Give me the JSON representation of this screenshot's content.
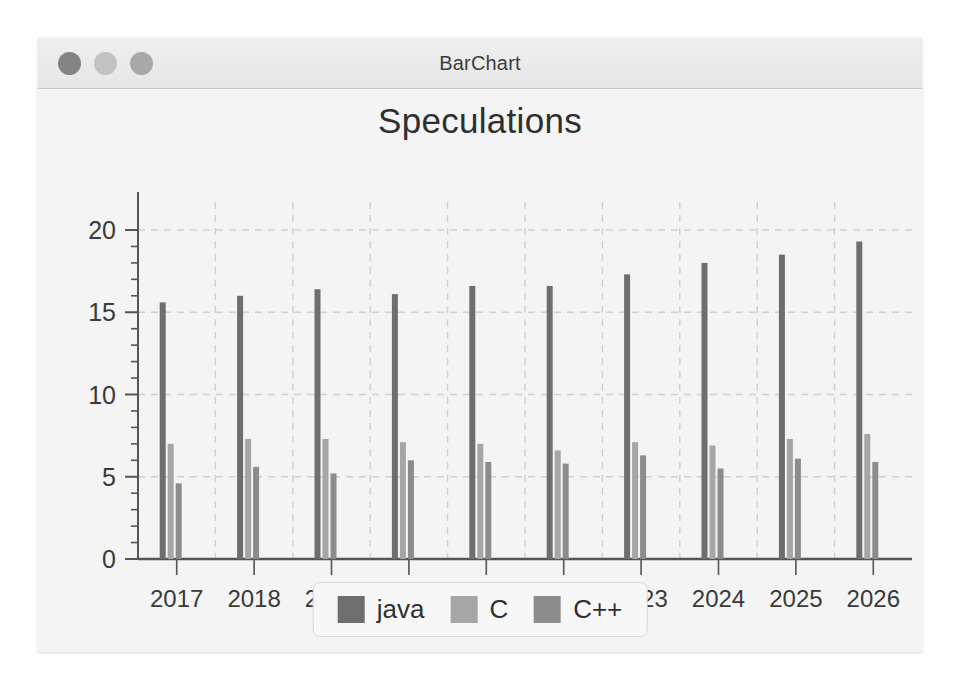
{
  "window": {
    "title": "BarChart",
    "controls": [
      {
        "name": "close-button",
        "color": "#848484"
      },
      {
        "name": "minimize-button",
        "color": "#c2c2c2"
      },
      {
        "name": "zoom-button",
        "color": "#a8a8a8"
      }
    ]
  },
  "chart_data": {
    "type": "bar",
    "title": "Speculations",
    "xlabel": "",
    "ylabel": "",
    "ylim": [
      0,
      20
    ],
    "yticks": [
      0,
      5,
      10,
      15,
      20
    ],
    "yminor_step": 1,
    "grid": true,
    "legend_position": "bottom",
    "categories": [
      "2017",
      "2018",
      "2019",
      "2020",
      "2021",
      "2022",
      "2023",
      "2024",
      "2025",
      "2026"
    ],
    "series": [
      {
        "name": "java",
        "color": "#6e6e6e",
        "values": [
          15.6,
          16.0,
          16.4,
          16.1,
          16.6,
          16.6,
          17.3,
          18.0,
          18.5,
          19.3
        ]
      },
      {
        "name": "C",
        "color": "#a6a6a6",
        "values": [
          7.0,
          7.3,
          7.3,
          7.1,
          7.0,
          6.6,
          7.1,
          6.9,
          7.3,
          7.6
        ]
      },
      {
        "name": "C++",
        "color": "#8c8c8c",
        "values": [
          4.6,
          5.6,
          5.2,
          6.0,
          5.9,
          5.8,
          6.3,
          5.5,
          6.1,
          5.9
        ]
      }
    ]
  },
  "legend": {
    "items": [
      {
        "label": "java",
        "color": "#6e6e6e"
      },
      {
        "label": "C",
        "color": "#a6a6a6"
      },
      {
        "label": "C++",
        "color": "#8c8c8c"
      }
    ]
  },
  "colors": {
    "axis": "#555555",
    "grid": "#cfcfcf",
    "background": "#f4f4f4",
    "text": "#2f2f2f"
  }
}
